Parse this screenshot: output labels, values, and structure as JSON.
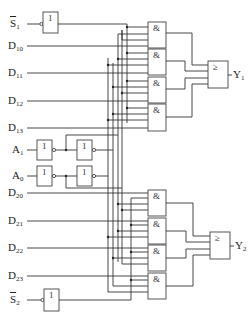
{
  "diagram": {
    "type": "dual 4-to-1 multiplexer logic circuit",
    "inputs": {
      "s1": {
        "base": "S",
        "sub": "1",
        "overbar": true
      },
      "d10": {
        "base": "D",
        "sub": "10"
      },
      "d11": {
        "base": "D",
        "sub": "11"
      },
      "d12": {
        "base": "D",
        "sub": "12"
      },
      "d13": {
        "base": "D",
        "sub": "13"
      },
      "a1": {
        "base": "A",
        "sub": "1"
      },
      "a0": {
        "base": "A",
        "sub": "0"
      },
      "d20": {
        "base": "D",
        "sub": "20"
      },
      "d21": {
        "base": "D",
        "sub": "21"
      },
      "d22": {
        "base": "D",
        "sub": "22"
      },
      "d23": {
        "base": "D",
        "sub": "23"
      },
      "s2": {
        "base": "S",
        "sub": "2",
        "overbar": true
      }
    },
    "outputs": {
      "y1": {
        "base": "Y",
        "sub": "1"
      },
      "y2": {
        "base": "Y",
        "sub": "2"
      }
    },
    "gate_symbols": {
      "not": "1",
      "and": "&",
      "or": "≥"
    },
    "gate_counts": {
      "not": 6,
      "and": 8,
      "or": 2
    }
  }
}
